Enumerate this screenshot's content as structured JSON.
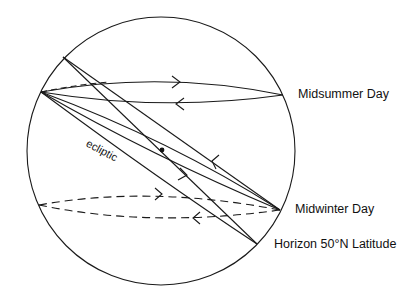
{
  "diagram": {
    "labels": {
      "midsummer": "Midsummer Day",
      "midwinter": "Midwinter Day",
      "horizon": "Horizon 50°N Latitude",
      "ecliptic": "ecliptic"
    },
    "colors": {
      "stroke": "#1a1a1a",
      "background": "#ffffff"
    }
  }
}
